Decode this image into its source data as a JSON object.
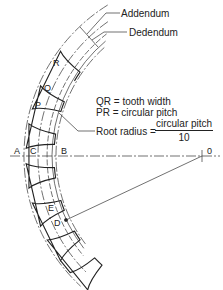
{
  "diagram": {
    "callouts": {
      "addendum": "Addendum",
      "dedendum": "Dedendum",
      "root_radius_label": "Root radius =",
      "root_radius_numerator": "circular pitch",
      "root_radius_denominator": "10"
    },
    "definitions": [
      "QR = tooth width",
      "PR = circular pitch"
    ],
    "points": {
      "A": "A",
      "B": "B",
      "C": "C",
      "D": "D",
      "E": "E",
      "P": "P",
      "Q": "Q",
      "R": "R",
      "O": "0"
    }
  }
}
